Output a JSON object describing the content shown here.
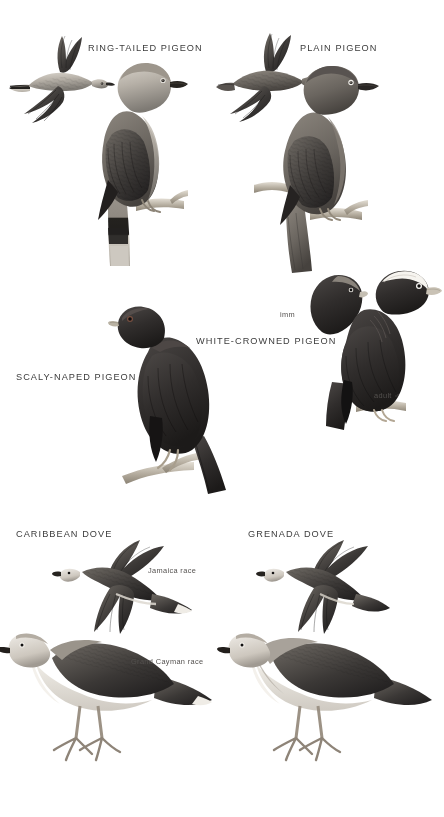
{
  "page": {
    "type": "field-guide-plate",
    "background_color": "#ffffff",
    "label_color": "#3c3c3c",
    "annotation_color": "#54514f",
    "palette": {
      "dark_plumage": "#2e2c2b",
      "mid_plumage": "#6e6a66",
      "light_plumage": "#c9c4bd",
      "pale_belly": "#f2efe9",
      "branch": "#b9b2a6",
      "eye_ring": "#ffffff"
    }
  },
  "species_labels": [
    {
      "id": "ring-tailed-pigeon",
      "text": "RING-TAILED PIGEON",
      "x": 88,
      "y": 43
    },
    {
      "id": "plain-pigeon",
      "text": "PLAIN PIGEON",
      "x": 300,
      "y": 43
    },
    {
      "id": "white-crowned-pigeon",
      "text": "WHITE-CROWNED PIGEON",
      "x": 196,
      "y": 336
    },
    {
      "id": "scaly-naped-pigeon",
      "text": "SCALY-NAPED PIGEON",
      "x": 16,
      "y": 372
    },
    {
      "id": "caribbean-dove",
      "text": "CARIBBEAN DOVE",
      "x": 16,
      "y": 529
    },
    {
      "id": "grenada-dove",
      "text": "GRENADA DOVE",
      "x": 248,
      "y": 529
    }
  ],
  "annotations": [
    {
      "id": "imm",
      "text": "imm",
      "x": 280,
      "y": 310
    },
    {
      "id": "adult-male",
      "text": "adult ♂",
      "x": 374,
      "y": 391
    },
    {
      "id": "jamaica-race",
      "text": "Jamaica race",
      "x": 148,
      "y": 566
    },
    {
      "id": "grand-cayman-race",
      "text": "Grand Cayman race",
      "x": 131,
      "y": 657
    }
  ],
  "figures": [
    {
      "id": "ring-tailed-pigeon-flight",
      "species": "RING-TAILED PIGEON",
      "pose": "flying",
      "x": 10,
      "y": 30,
      "w": 100,
      "h": 95
    },
    {
      "id": "ring-tailed-pigeon-perched",
      "species": "RING-TAILED PIGEON",
      "pose": "perched",
      "x": 60,
      "y": 55,
      "w": 125,
      "h": 215
    },
    {
      "id": "plain-pigeon-flight",
      "species": "PLAIN PIGEON",
      "pose": "flying",
      "x": 218,
      "y": 30,
      "w": 100,
      "h": 90
    },
    {
      "id": "plain-pigeon-perched",
      "species": "PLAIN PIGEON",
      "pose": "perched",
      "x": 250,
      "y": 58,
      "w": 125,
      "h": 215
    },
    {
      "id": "scaly-naped-pigeon-perched",
      "species": "SCALY-NAPED PIGEON",
      "pose": "perched",
      "x": 110,
      "y": 292,
      "w": 120,
      "h": 200
    },
    {
      "id": "white-crowned-pigeon-imm",
      "species": "WHITE-CROWNED PIGEON",
      "pose": "head",
      "x": 300,
      "y": 272,
      "w": 62,
      "h": 62
    },
    {
      "id": "white-crowned-pigeon-adult",
      "species": "WHITE-CROWNED PIGEON",
      "pose": "perched",
      "x": 330,
      "y": 268,
      "w": 108,
      "h": 160
    },
    {
      "id": "caribbean-dove-flight",
      "species": "CARIBBEAN DOVE",
      "pose": "flying",
      "x": 55,
      "y": 540,
      "w": 135,
      "h": 95
    },
    {
      "id": "caribbean-dove-standing",
      "species": "CARIBBEAN DOVE",
      "pose": "standing",
      "x": 8,
      "y": 610,
      "w": 205,
      "h": 160
    },
    {
      "id": "grenada-dove-flight",
      "species": "GRENADA DOVE",
      "pose": "flying",
      "x": 258,
      "y": 540,
      "w": 135,
      "h": 95
    },
    {
      "id": "grenada-dove-standing",
      "species": "GRENADA DOVE",
      "pose": "standing",
      "x": 228,
      "y": 610,
      "w": 205,
      "h": 160
    }
  ]
}
